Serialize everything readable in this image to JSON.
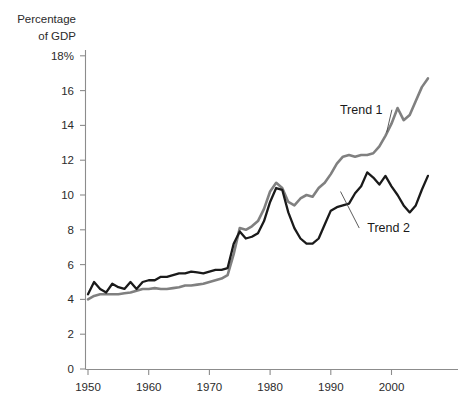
{
  "chart_data": {
    "type": "line",
    "title": "",
    "subtitle": "",
    "xlabel": "",
    "ylabel": "Percentage of GDP",
    "ylabel_line1": "Percentage",
    "ylabel_line2": "of GDP",
    "xlim": [
      1950,
      2006
    ],
    "ylim": [
      0,
      18
    ],
    "grid": false,
    "legend_position": "inline-annotation",
    "y_ticks": [
      0,
      2,
      4,
      6,
      8,
      10,
      12,
      14,
      16,
      18
    ],
    "y_tick_labels": [
      "0",
      "2",
      "4",
      "6",
      "8",
      "10",
      "12",
      "14",
      "16",
      "18%"
    ],
    "x_ticks": [
      1950,
      1960,
      1970,
      1980,
      1990,
      2000
    ],
    "x_tick_labels": [
      "1950",
      "1960",
      "1970",
      "1980",
      "1990",
      "2000"
    ],
    "annotations": [
      {
        "text": "Trend 1",
        "label_x": 1991.5,
        "label_y": 14.9,
        "target_x": 1999.2,
        "target_y": 13.6
      },
      {
        "text": "Trend 2",
        "label_x": 1996.0,
        "label_y": 8.1,
        "target_x": 1991.6,
        "target_y": 10.2
      }
    ],
    "x": [
      1950,
      1951,
      1952,
      1953,
      1954,
      1955,
      1956,
      1957,
      1958,
      1959,
      1960,
      1961,
      1962,
      1963,
      1964,
      1965,
      1966,
      1967,
      1968,
      1969,
      1970,
      1971,
      1972,
      1973,
      1974,
      1975,
      1976,
      1977,
      1978,
      1979,
      1980,
      1981,
      1982,
      1983,
      1984,
      1985,
      1986,
      1987,
      1988,
      1989,
      1990,
      1991,
      1992,
      1993,
      1994,
      1995,
      1996,
      1997,
      1998,
      1999,
      2000,
      2001,
      2002,
      2003,
      2004,
      2005,
      2006
    ],
    "series": [
      {
        "name": "Trend 1",
        "color": "#808080",
        "width": 2.6,
        "values": [
          4.0,
          4.2,
          4.3,
          4.3,
          4.3,
          4.3,
          4.35,
          4.4,
          4.5,
          4.6,
          4.6,
          4.65,
          4.6,
          4.6,
          4.65,
          4.7,
          4.8,
          4.8,
          4.85,
          4.9,
          5.0,
          5.1,
          5.2,
          5.4,
          6.6,
          8.1,
          8.0,
          8.2,
          8.5,
          9.2,
          10.2,
          10.7,
          10.4,
          9.6,
          9.4,
          9.8,
          10.0,
          9.9,
          10.4,
          10.7,
          11.2,
          11.8,
          12.2,
          12.3,
          12.2,
          12.3,
          12.3,
          12.4,
          12.8,
          13.4,
          14.1,
          15.0,
          14.3,
          14.6,
          15.4,
          16.2,
          16.7
        ]
      },
      {
        "name": "Trend 2",
        "color": "#1a1a1a",
        "width": 2.3,
        "values": [
          4.3,
          5.0,
          4.6,
          4.4,
          4.9,
          4.7,
          4.6,
          5.0,
          4.6,
          5.0,
          5.1,
          5.1,
          5.3,
          5.3,
          5.4,
          5.5,
          5.5,
          5.6,
          5.55,
          5.5,
          5.6,
          5.7,
          5.7,
          5.8,
          7.2,
          7.9,
          7.5,
          7.6,
          7.8,
          8.5,
          9.6,
          10.4,
          10.3,
          9.0,
          8.1,
          7.5,
          7.2,
          7.2,
          7.5,
          8.3,
          9.1,
          9.3,
          9.4,
          9.5,
          10.1,
          10.5,
          11.3,
          11.0,
          10.6,
          11.1,
          10.5,
          10.0,
          9.4,
          9.0,
          9.4,
          10.3,
          11.1
        ]
      }
    ]
  }
}
